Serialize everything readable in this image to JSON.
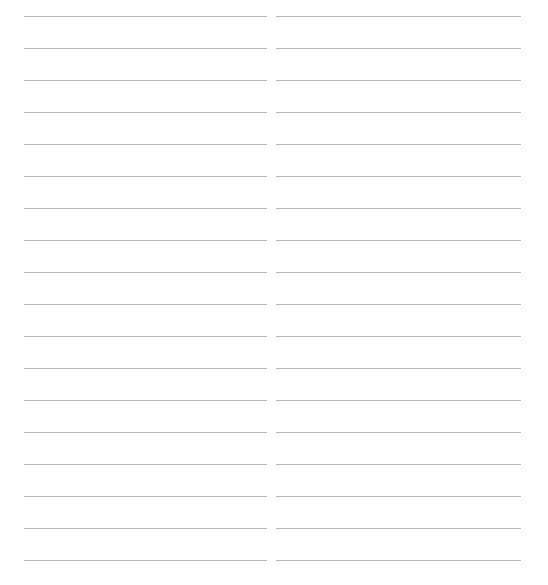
{
  "page": {
    "type": "lined-paper",
    "columns": [
      {
        "name": "left",
        "line_count": 18
      },
      {
        "name": "right",
        "line_count": 18
      }
    ],
    "rule_color": "#b8b8b8",
    "background_color": "#ffffff"
  }
}
